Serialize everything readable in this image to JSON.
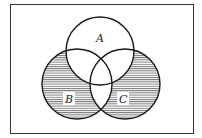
{
  "diagram": {
    "type": "venn",
    "sets": [
      {
        "id": "A",
        "label": "A"
      },
      {
        "id": "B",
        "label": "B"
      },
      {
        "id": "C",
        "label": "C"
      }
    ],
    "shaded_regions": [
      "B only",
      "C only"
    ],
    "shading_style": "horizontal-lines",
    "colors": {
      "stroke": "#1a1a1a",
      "hatch": "#555555",
      "background": "#ffffff"
    }
  }
}
